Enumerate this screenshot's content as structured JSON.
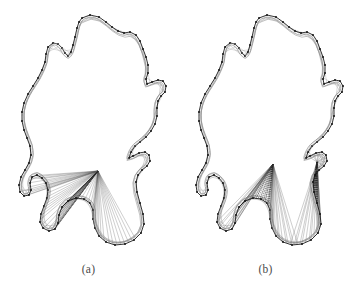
{
  "figure": {
    "type": "shape-correspondence-diagram",
    "background_color": "#ffffff",
    "ink_color": "#1a1a1a",
    "secondary_ink_color": "#8a8a8a",
    "width": 354,
    "height": 301,
    "panel_count": 2
  },
  "panels": [
    {
      "id": "a",
      "label": "(a)",
      "description": "Leaf-like closed contour pair with a single dense correspondence fan",
      "fan_count": 1,
      "fan_apexes": [
        [
          98,
          171
        ]
      ],
      "marker_color": "#111111",
      "curve_color": "#8f8f8f",
      "correspondence_line_color": "#555555"
    },
    {
      "id": "b",
      "label": "(b)",
      "description": "Leaf-like closed contour pair with two separate correspondence fans",
      "fan_count": 2,
      "fan_apexes": [
        [
          96,
          164
        ],
        [
          140,
          162
        ]
      ],
      "marker_color": "#111111",
      "curve_color": "#8f8f8f",
      "correspondence_line_color": "#555555"
    }
  ],
  "shape_data": {
    "type": "contour",
    "title": "",
    "xlabel": "",
    "ylabel": "",
    "grid": false,
    "legend": "none",
    "outer_contour_a": [
      [
        82,
        18
      ],
      [
        90,
        15
      ],
      [
        99,
        17
      ],
      [
        106,
        22
      ],
      [
        112,
        27
      ],
      [
        118,
        31
      ],
      [
        124,
        33
      ],
      [
        130,
        32
      ],
      [
        136,
        35
      ],
      [
        140,
        41
      ],
      [
        143,
        49
      ],
      [
        146,
        57
      ],
      [
        148,
        65
      ],
      [
        148,
        73
      ],
      [
        146,
        79
      ],
      [
        147,
        84
      ],
      [
        152,
        82
      ],
      [
        158,
        80
      ],
      [
        163,
        81
      ],
      [
        166,
        86
      ],
      [
        165,
        92
      ],
      [
        161,
        96
      ],
      [
        158,
        101
      ],
      [
        157,
        108
      ],
      [
        157,
        116
      ],
      [
        155,
        124
      ],
      [
        151,
        131
      ],
      [
        146,
        137
      ],
      [
        140,
        142
      ],
      [
        135,
        146
      ],
      [
        131,
        152
      ],
      [
        129,
        158
      ],
      [
        133,
        156
      ],
      [
        139,
        153
      ],
      [
        145,
        152
      ],
      [
        149,
        155
      ],
      [
        150,
        161
      ],
      [
        147,
        166
      ],
      [
        142,
        170
      ],
      [
        138,
        175
      ],
      [
        136,
        182
      ],
      [
        137,
        192
      ],
      [
        140,
        203
      ],
      [
        143,
        214
      ],
      [
        144,
        224
      ],
      [
        141,
        233
      ],
      [
        134,
        240
      ],
      [
        125,
        244
      ],
      [
        115,
        245
      ],
      [
        106,
        242
      ],
      [
        99,
        236
      ],
      [
        95,
        228
      ],
      [
        93,
        219
      ],
      [
        93,
        210
      ],
      [
        90,
        203
      ],
      [
        84,
        199
      ],
      [
        76,
        198
      ],
      [
        68,
        201
      ],
      [
        62,
        207
      ],
      [
        59,
        215
      ],
      [
        58,
        223
      ],
      [
        55,
        229
      ],
      [
        49,
        231
      ],
      [
        43,
        228
      ],
      [
        40,
        222
      ],
      [
        41,
        214
      ],
      [
        44,
        206
      ],
      [
        47,
        198
      ],
      [
        48,
        190
      ],
      [
        46,
        183
      ],
      [
        42,
        178
      ],
      [
        37,
        175
      ],
      [
        32,
        177
      ],
      [
        30,
        183
      ],
      [
        31,
        190
      ],
      [
        29,
        195
      ],
      [
        24,
        196
      ],
      [
        20,
        192
      ],
      [
        19,
        185
      ],
      [
        21,
        177
      ],
      [
        25,
        170
      ],
      [
        29,
        163
      ],
      [
        31,
        155
      ],
      [
        30,
        146
      ],
      [
        27,
        138
      ],
      [
        24,
        130
      ],
      [
        22,
        121
      ],
      [
        22,
        112
      ],
      [
        24,
        103
      ],
      [
        28,
        94
      ],
      [
        33,
        86
      ],
      [
        38,
        78
      ],
      [
        42,
        70
      ],
      [
        45,
        62
      ],
      [
        46,
        54
      ],
      [
        48,
        47
      ],
      [
        53,
        43
      ],
      [
        58,
        44
      ],
      [
        62,
        48
      ],
      [
        65,
        53
      ],
      [
        68,
        56
      ],
      [
        71,
        52
      ],
      [
        73,
        45
      ],
      [
        75,
        37
      ],
      [
        77,
        28
      ],
      [
        79,
        22
      ]
    ],
    "inner_contour_a": [
      [
        83,
        21
      ],
      [
        91,
        18
      ],
      [
        100,
        20
      ],
      [
        107,
        25
      ],
      [
        113,
        30
      ],
      [
        119,
        34
      ],
      [
        125,
        36
      ],
      [
        131,
        35
      ],
      [
        136,
        38
      ],
      [
        140,
        44
      ],
      [
        143,
        52
      ],
      [
        145,
        60
      ],
      [
        147,
        68
      ],
      [
        147,
        75
      ],
      [
        145,
        81
      ],
      [
        146,
        86
      ],
      [
        151,
        84
      ],
      [
        157,
        82
      ],
      [
        162,
        83
      ],
      [
        164,
        88
      ],
      [
        163,
        93
      ],
      [
        159,
        97
      ],
      [
        156,
        103
      ],
      [
        155,
        110
      ],
      [
        155,
        118
      ],
      [
        153,
        126
      ],
      [
        149,
        133
      ],
      [
        144,
        139
      ],
      [
        139,
        144
      ],
      [
        134,
        148
      ],
      [
        130,
        154
      ],
      [
        128,
        160
      ],
      [
        132,
        158
      ],
      [
        138,
        155
      ],
      [
        144,
        154
      ],
      [
        147,
        157
      ],
      [
        148,
        162
      ],
      [
        145,
        167
      ],
      [
        140,
        171
      ],
      [
        136,
        176
      ],
      [
        134,
        183
      ],
      [
        135,
        193
      ],
      [
        138,
        204
      ],
      [
        141,
        215
      ],
      [
        142,
        225
      ],
      [
        139,
        233
      ],
      [
        132,
        239
      ],
      [
        124,
        243
      ],
      [
        114,
        244
      ],
      [
        105,
        241
      ],
      [
        98,
        235
      ],
      [
        94,
        227
      ],
      [
        92,
        218
      ],
      [
        92,
        209
      ],
      [
        89,
        202
      ],
      [
        83,
        198
      ],
      [
        75,
        197
      ],
      [
        67,
        200
      ],
      [
        61,
        206
      ],
      [
        58,
        214
      ],
      [
        57,
        222
      ],
      [
        54,
        228
      ],
      [
        48,
        230
      ],
      [
        43,
        227
      ],
      [
        40,
        221
      ],
      [
        41,
        213
      ],
      [
        44,
        205
      ],
      [
        47,
        197
      ],
      [
        48,
        189
      ],
      [
        46,
        182
      ],
      [
        42,
        177
      ],
      [
        37,
        174
      ],
      [
        32,
        176
      ],
      [
        30,
        182
      ],
      [
        31,
        189
      ],
      [
        29,
        194
      ],
      [
        24,
        195
      ],
      [
        21,
        191
      ],
      [
        20,
        184
      ],
      [
        22,
        176
      ],
      [
        26,
        169
      ],
      [
        30,
        162
      ],
      [
        32,
        154
      ],
      [
        31,
        145
      ],
      [
        28,
        137
      ],
      [
        25,
        129
      ],
      [
        23,
        120
      ],
      [
        23,
        111
      ],
      [
        25,
        102
      ],
      [
        29,
        93
      ],
      [
        34,
        85
      ],
      [
        39,
        77
      ],
      [
        43,
        69
      ],
      [
        46,
        61
      ],
      [
        47,
        53
      ],
      [
        49,
        46
      ],
      [
        54,
        42
      ],
      [
        59,
        43
      ],
      [
        63,
        47
      ],
      [
        66,
        52
      ],
      [
        69,
        55
      ],
      [
        72,
        51
      ],
      [
        74,
        44
      ],
      [
        76,
        36
      ],
      [
        78,
        27
      ],
      [
        80,
        21
      ]
    ],
    "fan_target_arc_a": [
      [
        60,
        207
      ],
      [
        64,
        213
      ],
      [
        68,
        219
      ],
      [
        72,
        224
      ],
      [
        76,
        229
      ],
      [
        80,
        233
      ],
      [
        84,
        237
      ],
      [
        88,
        240
      ],
      [
        93,
        242
      ],
      [
        97,
        243
      ],
      [
        102,
        243
      ],
      [
        107,
        242
      ],
      [
        112,
        240
      ],
      [
        117,
        237
      ],
      [
        122,
        233
      ],
      [
        126,
        229
      ],
      [
        130,
        224
      ],
      [
        133,
        219
      ],
      [
        136,
        213
      ],
      [
        138,
        207
      ],
      [
        140,
        201
      ],
      [
        141,
        195
      ],
      [
        141,
        189
      ],
      [
        140,
        183
      ]
    ],
    "marker_count_outer": 108,
    "marker_count_inner": 108,
    "correspondence_ray_count_a": 52,
    "correspondence_ray_count_b": 64
  }
}
